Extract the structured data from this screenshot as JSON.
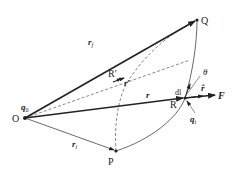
{
  "diagram": {
    "points": {
      "O": "O",
      "Q": "Q",
      "P": "P",
      "R": "R",
      "R_prime": "R'"
    },
    "charges": {
      "source": "q0",
      "test": "qt"
    },
    "vectors": {
      "r_Q": "r_f",
      "r_P": "r_i",
      "r": "r",
      "r_prime": "r'",
      "r_hat": "r̂",
      "F": "F",
      "dl": "dl"
    },
    "angle": "θ",
    "labels": {
      "O": "O",
      "Q": "Q",
      "P": "P",
      "R": "R",
      "R_prime": "R′",
      "q0_base": "q",
      "q0_sub": "0",
      "qt_base": "q",
      "qt_sub": "t",
      "rf_base": "r",
      "rf_sub": "f",
      "ri_base": "r",
      "ri_sub": "i",
      "r": "r",
      "r_prime": "r′",
      "r_hat": "r̂",
      "F": "F",
      "dl": "dl",
      "theta": "θ"
    },
    "colors": {
      "ink": "#222222",
      "dashed": "#555555",
      "curve": "#444444"
    }
  }
}
